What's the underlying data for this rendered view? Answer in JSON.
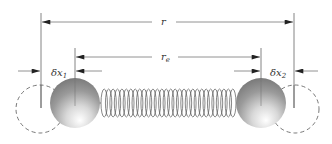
{
  "diagram": {
    "labels": {
      "r": "r",
      "r_e": "r",
      "r_e_sub": "e",
      "dx1": "δx",
      "dx1_sub": "1",
      "dx2": "δx",
      "dx2_sub": "2"
    },
    "colors": {
      "line": "#555555",
      "arrow": "#222222",
      "sphere_dark": "#7a7a7a",
      "sphere_light": "#ffffff",
      "spring": "#555555",
      "dashed": "#555555"
    },
    "spring": {
      "coils": 30
    }
  }
}
